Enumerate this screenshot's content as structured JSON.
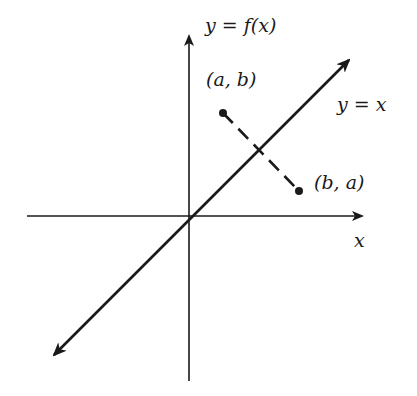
{
  "diagram": {
    "labels": {
      "y_axis": "y = f(x)",
      "x_axis": "x",
      "line": "y = x",
      "point_ab": "(a, b)",
      "point_ba": "(b, a)"
    },
    "geometry": {
      "origin": [
        189,
        216
      ],
      "x_axis": {
        "from": [
          27,
          216
        ],
        "to": [
          363,
          216
        ],
        "arrow": "right"
      },
      "y_axis": {
        "from": [
          189,
          381
        ],
        "to": [
          189,
          35
        ],
        "arrow": "up"
      },
      "identity_line": {
        "from": [
          52,
          357
        ],
        "to": [
          351,
          58
        ],
        "arrows": "both"
      },
      "point_ab": [
        223,
        113
      ],
      "point_ba": [
        299,
        191
      ],
      "segment_style": "dashed"
    },
    "colors": {
      "ink": "#1a1a1a",
      "background": "#ffffff"
    }
  }
}
